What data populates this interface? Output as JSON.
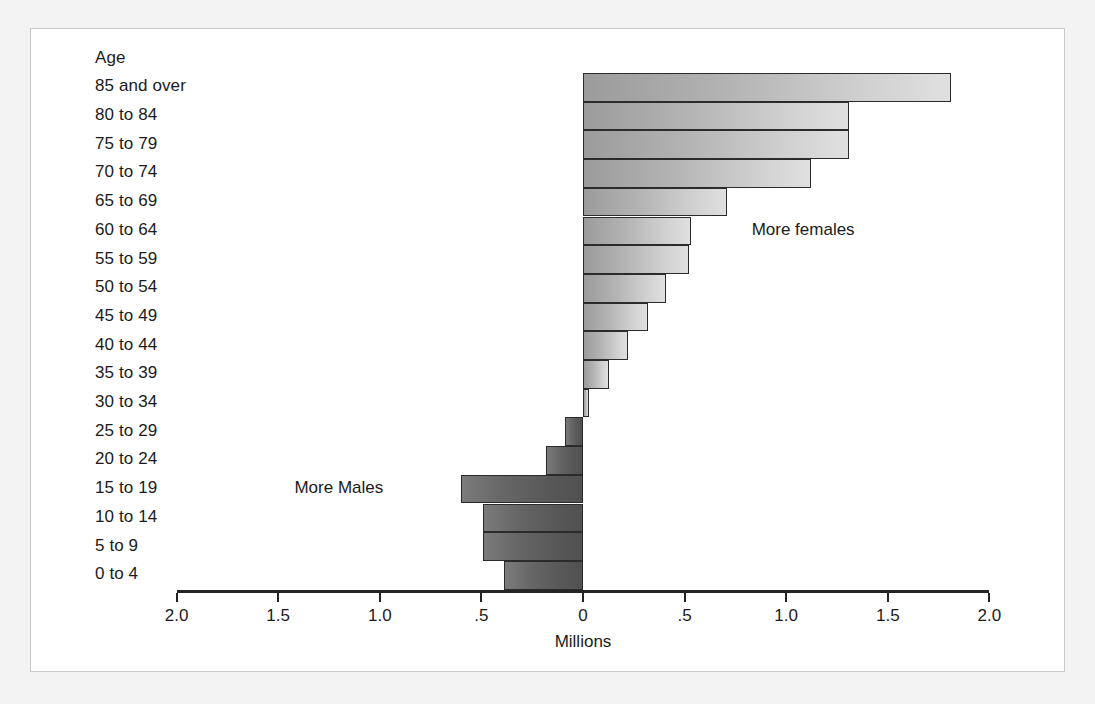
{
  "chart_data": {
    "type": "bar",
    "title": "",
    "subtitle": "",
    "orientation": "horizontal",
    "layout": "population-pyramid-difference",
    "xlabel": "Millions",
    "ylabel": "Age",
    "xlim": [
      -2.0,
      2.0
    ],
    "grid": false,
    "legend_position": "none",
    "xtick_values": [
      -2.0,
      -1.5,
      -1.0,
      -0.5,
      0,
      0.5,
      1.0,
      1.5,
      2.0
    ],
    "xtick_labels": [
      "2.0",
      "1.5",
      "1.0",
      ".5",
      "0",
      ".5",
      "1.0",
      "1.5",
      "2.0"
    ],
    "categories": [
      "85 and over",
      "80 to 84",
      "75 to 79",
      "70 to 74",
      "65 to 69",
      "60 to 64",
      "55 to 59",
      "50 to 54",
      "45 to 49",
      "40 to 44",
      "35 to 39",
      "30 to 34",
      "25 to 29",
      "20 to 24",
      "15 to 19",
      "10 to 14",
      "5 to 9",
      "0 to 4"
    ],
    "values": [
      1.81,
      1.31,
      1.31,
      1.12,
      0.71,
      0.53,
      0.52,
      0.41,
      0.32,
      0.22,
      0.13,
      0.03,
      -0.09,
      -0.18,
      -0.6,
      -0.49,
      -0.49,
      -0.39
    ],
    "annotations": [
      {
        "text": "More females",
        "x": 0.83,
        "category": "60 to 64"
      },
      {
        "text": "More Males",
        "x": -1.42,
        "category": "15 to 19"
      }
    ],
    "series_colors": {
      "more_females": "#b4b4b4",
      "more_males": "#5f5f5f",
      "bar_border": "#2b2b2b",
      "axis": "#232323",
      "text": "#1b1b1b",
      "panel_background": "#ffffff",
      "page_background": "#f3f3f3"
    }
  },
  "labels": {
    "age_header": "Age",
    "axis_title": "Millions",
    "more_females": "More females",
    "more_males": "More Males"
  }
}
